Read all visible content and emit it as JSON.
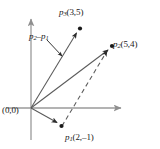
{
  "figure": {
    "name": "vector-subtraction-diagram",
    "background_color": "#ffffff",
    "axis_color": "#9a9a9a",
    "vector_color": "#555555",
    "label_color": "#1a1a1a"
  },
  "axes": {
    "x_axis_name": "horizontal-axis",
    "y_axis_name": "vertical-axis",
    "origin_label": "(0,0)",
    "origin_px": {
      "x": 31,
      "y": 108
    },
    "x_axis_end_px": {
      "x": 124,
      "y": 108
    },
    "y_axis_end_px": {
      "x": 31,
      "y": 16
    }
  },
  "points": [
    {
      "id": "p1",
      "label_name": "p1",
      "label_sub": "1",
      "coords_text": "(2,–1)",
      "x": 2,
      "y": -1,
      "px": {
        "x": 61,
        "y": 126
      }
    },
    {
      "id": "p2",
      "label_name": "p2",
      "label_sub": "2",
      "coords_text": "(5,4)",
      "x": 5,
      "y": 4,
      "px": {
        "x": 112,
        "y": 46
      }
    },
    {
      "id": "p3",
      "label_name": "p3",
      "label_sub": "3",
      "coords_text": "(3,5)",
      "x": 3,
      "y": 5,
      "px": {
        "x": 80,
        "y": 28
      }
    }
  ],
  "annotation": {
    "name": "p2-minus-p1",
    "label_main": "p",
    "sub_a": "2",
    "minus": "–",
    "label_second": "p",
    "sub_b": "1",
    "leader_from_px": {
      "x": 49,
      "y": 41
    },
    "leader_to_px": {
      "x": 62,
      "y": 55
    }
  },
  "vectors": [
    {
      "name": "vector-to-p1",
      "style": "solid",
      "from": "origin",
      "to": "p1"
    },
    {
      "name": "vector-to-p2",
      "style": "solid",
      "from": "origin",
      "to": "p2"
    },
    {
      "name": "vector-to-p3",
      "style": "solid",
      "from": "origin",
      "to": "p3"
    },
    {
      "name": "vector-p1-to-p2-dashed",
      "style": "dashed",
      "from": "p1",
      "to": "p2"
    }
  ]
}
